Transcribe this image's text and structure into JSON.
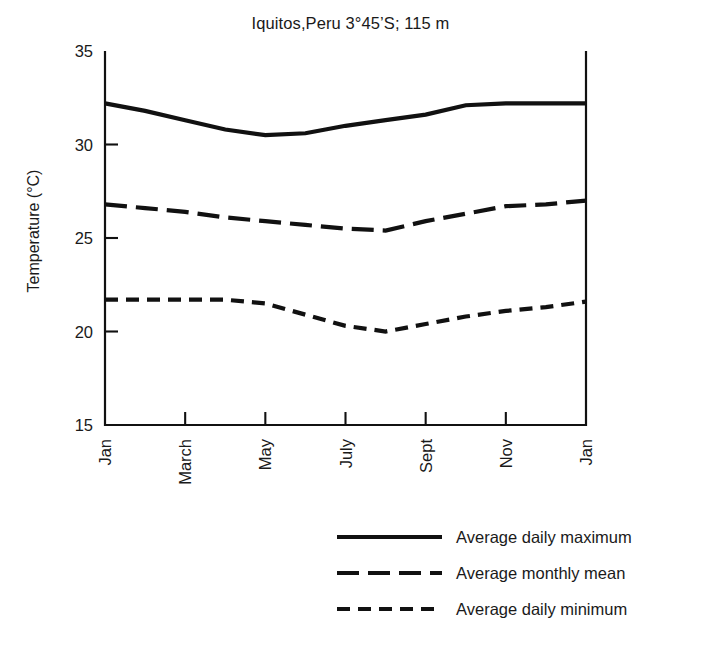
{
  "chart_data": {
    "type": "line",
    "title": "Iquitos,Peru  3°45’S; 115 m",
    "xlabel": "",
    "ylabel": "Temperature (°C)",
    "ylim": [
      15,
      35
    ],
    "yticks": [
      15,
      20,
      25,
      30,
      35
    ],
    "ytick_labels": [
      "15",
      "20",
      "25",
      "30",
      "35"
    ],
    "grid": false,
    "legend_position": "bottom-right",
    "x": [
      "Jan",
      "Feb",
      "March",
      "April",
      "May",
      "June",
      "July",
      "Aug",
      "Sept",
      "Oct",
      "Nov",
      "Dec",
      "Jan"
    ],
    "xticks": [
      "Jan",
      "March",
      "May",
      "July",
      "Sept",
      "Nov",
      "Jan"
    ],
    "xtick_positions": [
      0,
      2,
      4,
      6,
      8,
      10,
      12
    ],
    "series": [
      {
        "name": "Average daily maximum",
        "style": "solid",
        "values": [
          32.2,
          31.8,
          31.3,
          30.8,
          30.5,
          30.6,
          31.0,
          31.3,
          31.6,
          32.1,
          32.2,
          32.2,
          32.2
        ]
      },
      {
        "name": "Average monthly mean",
        "style": "long-dash",
        "values": [
          26.8,
          26.6,
          26.4,
          26.1,
          25.9,
          25.7,
          25.5,
          25.4,
          25.9,
          26.3,
          26.7,
          26.8,
          27.0
        ]
      },
      {
        "name": "Average daily minimum",
        "style": "short-dash",
        "values": [
          21.7,
          21.7,
          21.7,
          21.7,
          21.5,
          20.9,
          20.3,
          20.0,
          20.4,
          20.8,
          21.1,
          21.3,
          21.6
        ]
      }
    ]
  },
  "legend": {
    "items": [
      {
        "label": "Average daily maximum",
        "style": "solid"
      },
      {
        "label": "Average monthly mean",
        "style": "long-dash"
      },
      {
        "label": "Average daily minimum",
        "style": "short-dash"
      }
    ]
  },
  "colors": {
    "line": "#111111",
    "text": "#1a1a1a",
    "background": "#ffffff"
  }
}
